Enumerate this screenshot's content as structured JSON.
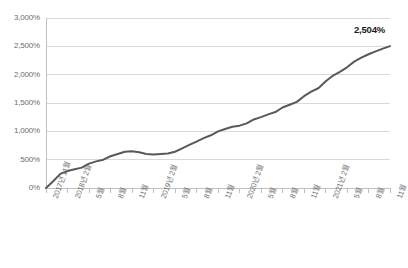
{
  "chart_data": {
    "type": "line",
    "title": "",
    "subtitle": "",
    "xlabel": "",
    "ylabel": "",
    "ylim": [
      0,
      3000
    ],
    "y_unit": "%",
    "grid": true,
    "legend": false,
    "y_ticks": [
      0,
      500,
      1000,
      1500,
      2000,
      2500,
      3000
    ],
    "y_tick_labels": [
      "0%",
      "500%",
      "1,000%",
      "1,500%",
      "2,000%",
      "2,500%",
      "3,000%"
    ],
    "x_tick_labels": [
      "2017년 11월",
      "2018년 2월",
      "5월",
      "8월",
      "11월",
      "2019년 2월",
      "5월",
      "8월",
      "11월",
      "2020년 2월",
      "5월",
      "8월",
      "11월",
      "2021년 2월",
      "5월",
      "8월",
      "11월"
    ],
    "annotations": [
      {
        "text": "2,504%",
        "x": "2021년 11월",
        "y": 2504
      }
    ],
    "series": [
      {
        "name": "누적 수익률",
        "color": "#595959",
        "x": [
          "2017-11",
          "2017-12",
          "2018-01",
          "2018-02",
          "2018-03",
          "2018-04",
          "2018-05",
          "2018-06",
          "2018-07",
          "2018-08",
          "2018-09",
          "2018-10",
          "2018-11",
          "2018-12",
          "2019-01",
          "2019-02",
          "2019-03",
          "2019-04",
          "2019-05",
          "2019-06",
          "2019-07",
          "2019-08",
          "2019-09",
          "2019-10",
          "2019-11",
          "2019-12",
          "2020-01",
          "2020-02",
          "2020-03",
          "2020-04",
          "2020-05",
          "2020-06",
          "2020-07",
          "2020-08",
          "2020-09",
          "2020-10",
          "2020-11",
          "2020-12",
          "2021-01",
          "2021-02",
          "2021-03",
          "2021-04",
          "2021-05",
          "2021-06",
          "2021-07",
          "2021-08",
          "2021-09",
          "2021-10",
          "2021-11"
        ],
        "values": [
          0,
          120,
          250,
          300,
          330,
          360,
          430,
          470,
          500,
          560,
          600,
          640,
          650,
          630,
          600,
          590,
          600,
          610,
          640,
          700,
          760,
          820,
          880,
          930,
          1000,
          1040,
          1080,
          1100,
          1140,
          1210,
          1250,
          1300,
          1340,
          1420,
          1470,
          1520,
          1620,
          1700,
          1760,
          1880,
          1980,
          2050,
          2130,
          2230,
          2300,
          2360,
          2410,
          2460,
          2504
        ]
      }
    ]
  },
  "axis_colors": {
    "grid": "#d9d9d9",
    "axis": "#bfbfbf",
    "tick_text": "#6e6e6e",
    "line": "#595959",
    "annotation": "#1a1a1a"
  }
}
